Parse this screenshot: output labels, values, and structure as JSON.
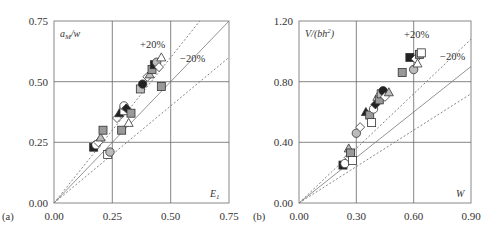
{
  "chart_data": [
    {
      "type": "scatter",
      "panel_label": "(a)",
      "title": "",
      "xlabel": "E1",
      "ylabel": "aM/w",
      "xlim": [
        0,
        0.75
      ],
      "ylim": [
        0,
        0.75
      ],
      "xticks": [
        "0.00",
        "0.25",
        "0.50",
        "0.75"
      ],
      "yticks": [
        "0.00",
        "0.25",
        "0.50",
        "0.75"
      ],
      "grid": true,
      "reference_lines": [
        {
          "name": "y = x",
          "style": "solid",
          "slope": 1.0
        },
        {
          "name": "+20%",
          "style": "dotted",
          "slope": 1.2
        },
        {
          "name": "-20%",
          "style": "dotted",
          "slope": 0.8
        }
      ],
      "annotations": [
        "+20%",
        "-20%"
      ],
      "points": [
        [
          0.17,
          0.23
        ],
        [
          0.18,
          0.24
        ],
        [
          0.19,
          0.25
        ],
        [
          0.2,
          0.27
        ],
        [
          0.21,
          0.3
        ],
        [
          0.23,
          0.2
        ],
        [
          0.24,
          0.21
        ],
        [
          0.27,
          0.35
        ],
        [
          0.28,
          0.37
        ],
        [
          0.29,
          0.3
        ],
        [
          0.3,
          0.38
        ],
        [
          0.3,
          0.4
        ],
        [
          0.31,
          0.39
        ],
        [
          0.32,
          0.33
        ],
        [
          0.33,
          0.37
        ],
        [
          0.37,
          0.47
        ],
        [
          0.38,
          0.49
        ],
        [
          0.4,
          0.52
        ],
        [
          0.41,
          0.53
        ],
        [
          0.42,
          0.55
        ],
        [
          0.43,
          0.57
        ],
        [
          0.44,
          0.58
        ],
        [
          0.45,
          0.56
        ],
        [
          0.46,
          0.6
        ],
        [
          0.46,
          0.48
        ]
      ]
    },
    {
      "type": "scatter",
      "panel_label": "(b)",
      "title": "",
      "xlabel": "W",
      "ylabel": "V/(bh²)",
      "xlim": [
        0,
        0.9
      ],
      "ylim": [
        0,
        1.2
      ],
      "xticks": [
        "0.00",
        "0.30",
        "0.60",
        "0.90"
      ],
      "yticks": [
        "0.00",
        "0.40",
        "0.80",
        "1.20"
      ],
      "grid": true,
      "reference_lines": [
        {
          "name": "y = x",
          "style": "solid",
          "slope": 1.0
        },
        {
          "name": "+20%",
          "style": "dotted",
          "slope": 1.2
        },
        {
          "name": "-20%",
          "style": "dotted",
          "slope": 0.8
        }
      ],
      "annotations": [
        "+20%",
        "-20%"
      ],
      "points": [
        [
          0.23,
          0.25
        ],
        [
          0.24,
          0.26
        ],
        [
          0.26,
          0.3
        ],
        [
          0.26,
          0.36
        ],
        [
          0.27,
          0.33
        ],
        [
          0.28,
          0.28
        ],
        [
          0.3,
          0.46
        ],
        [
          0.32,
          0.5
        ],
        [
          0.35,
          0.6
        ],
        [
          0.37,
          0.58
        ],
        [
          0.38,
          0.53
        ],
        [
          0.39,
          0.62
        ],
        [
          0.4,
          0.65
        ],
        [
          0.41,
          0.7
        ],
        [
          0.42,
          0.68
        ],
        [
          0.43,
          0.72
        ],
        [
          0.44,
          0.74
        ],
        [
          0.45,
          0.7
        ],
        [
          0.47,
          0.73
        ],
        [
          0.54,
          0.86
        ],
        [
          0.58,
          0.96
        ],
        [
          0.6,
          0.88
        ],
        [
          0.61,
          0.95
        ],
        [
          0.62,
          0.92
        ],
        [
          0.63,
          0.98
        ],
        [
          0.64,
          0.99
        ]
      ]
    }
  ],
  "panels": {
    "a": {
      "label": "(a)",
      "ylabel_text": "a",
      "ylabel_sub": "M",
      "ylabel_rest": "/w",
      "xlabel_text": "E",
      "xlabel_sub": "1",
      "plus20": "+20%",
      "minus20": "−20%",
      "xticks": [
        "0.00",
        "0.25",
        "0.50",
        "0.75"
      ],
      "yticks": [
        "0.00",
        "0.25",
        "0.50",
        "0.75"
      ]
    },
    "b": {
      "label": "(b)",
      "ylabel_text": "V/(bh",
      "ylabel_sup": "2",
      "ylabel_rest": ")",
      "xlabel_text": "W",
      "plus20": "+20%",
      "minus20": "−20%",
      "xticks": [
        "0.00",
        "0.30",
        "0.60",
        "0.90"
      ],
      "yticks": [
        "0.00",
        "0.40",
        "0.80",
        "1.20"
      ]
    }
  }
}
